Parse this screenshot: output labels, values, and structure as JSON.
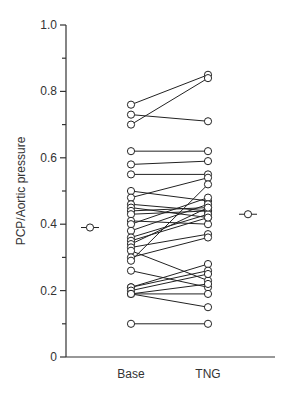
{
  "chart_data": {
    "type": "scatter",
    "title": "",
    "xlabel": "",
    "ylabel": "PCP/Aortic pressure",
    "ylim": [
      0,
      1.0
    ],
    "yticks": [
      "0",
      "0.2",
      "0.4",
      "0.6",
      "0.8",
      "1.0"
    ],
    "categories": [
      "Base",
      "TNG"
    ],
    "grid": false,
    "legend": null,
    "paired_lines": true,
    "pairs": [
      [
        0.76,
        0.85
      ],
      [
        0.73,
        0.71
      ],
      [
        0.7,
        0.84
      ],
      [
        0.62,
        0.62
      ],
      [
        0.58,
        0.59
      ],
      [
        0.55,
        0.55
      ],
      [
        0.5,
        0.47
      ],
      [
        0.48,
        0.54
      ],
      [
        0.46,
        0.44
      ],
      [
        0.45,
        0.42
      ],
      [
        0.44,
        0.45
      ],
      [
        0.43,
        0.44
      ],
      [
        0.41,
        0.4
      ],
      [
        0.4,
        0.48
      ],
      [
        0.38,
        0.46
      ],
      [
        0.36,
        0.43
      ],
      [
        0.35,
        0.42
      ],
      [
        0.34,
        0.45
      ],
      [
        0.33,
        0.37
      ],
      [
        0.32,
        0.23
      ],
      [
        0.3,
        0.36
      ],
      [
        0.29,
        0.52
      ],
      [
        0.26,
        0.21
      ],
      [
        0.21,
        0.28
      ],
      [
        0.21,
        0.26
      ],
      [
        0.2,
        0.25
      ],
      [
        0.19,
        0.22
      ],
      [
        0.19,
        0.19
      ],
      [
        0.19,
        0.15
      ],
      [
        0.1,
        0.1
      ]
    ],
    "means": {
      "Base": 0.39,
      "TNG": 0.43
    }
  },
  "axis": {
    "ylabel": "PCP/Aortic pressure",
    "xlabels": [
      "Base",
      "TNG"
    ],
    "yticklabels": [
      "0",
      "0.2",
      "0.4",
      "0.6",
      "0.8",
      "1.0"
    ]
  }
}
